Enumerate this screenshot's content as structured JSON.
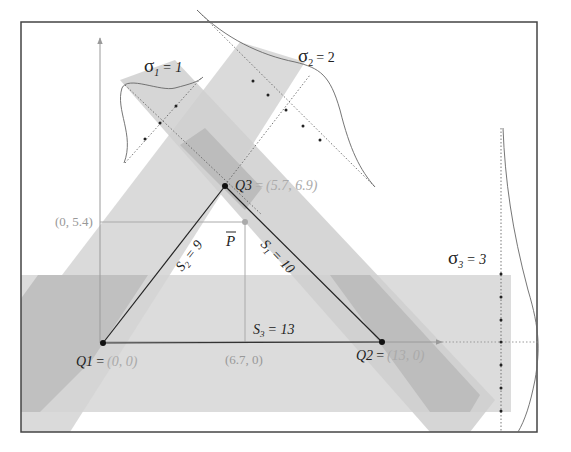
{
  "diagram": {
    "colors": {
      "frame": "#444444",
      "band_light": "#dcdcdc",
      "band_dark": "#c2c2c2",
      "axis": "#9a9a9a",
      "edge": "#222222",
      "coord_text": "#9a9a9a",
      "label_text": "#222222"
    },
    "points": {
      "q1": {
        "name": "Q1",
        "eq": "=",
        "coord": "(0, 0)"
      },
      "q2": {
        "name": "Q2",
        "eq": "=",
        "coord": "(13, 0)"
      },
      "q3": {
        "name": "Q3",
        "eq": "=",
        "coord": "(5.7, 6.9)"
      },
      "pbar": {
        "name": "P"
      }
    },
    "projections": {
      "y_proj": "(0, 5.4)",
      "x_proj": "(6.7, 0)"
    },
    "sides": {
      "s1": {
        "name": "S",
        "sub": "1",
        "value": "= 10"
      },
      "s2": {
        "name": "S",
        "sub": "2",
        "value": "= 9"
      },
      "s3": {
        "name": "S",
        "sub": "3",
        "value": "= 13"
      }
    },
    "sigmas": {
      "sigma1": {
        "sym": "σ",
        "sub": "1",
        "value": "= 1"
      },
      "sigma2": {
        "sym": "σ",
        "sub": "2",
        "value": "= 2"
      },
      "sigma3": {
        "sym": "σ",
        "sub": "3",
        "value": "= 3"
      }
    }
  }
}
